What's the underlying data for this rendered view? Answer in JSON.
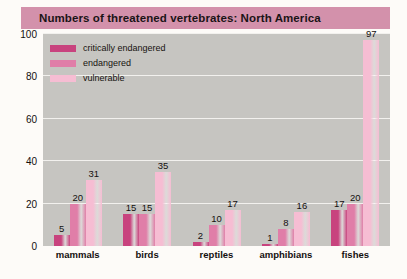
{
  "chart_data": {
    "type": "bar",
    "title": "Numbers of threatened vertebrates: North America",
    "xlabel": "",
    "ylabel": "",
    "ylim": [
      0,
      100
    ],
    "yticks": [
      0,
      20,
      40,
      60,
      80,
      100
    ],
    "grid": true,
    "legend_position": "top-left",
    "categories": [
      "mammals",
      "birds",
      "reptiles",
      "amphibians",
      "fishes"
    ],
    "series": [
      {
        "name": "critically endangered",
        "color": "#c8437e",
        "values": [
          5,
          15,
          2,
          1,
          17
        ]
      },
      {
        "name": "endangered",
        "color": "#e07ea8",
        "values": [
          20,
          15,
          10,
          8,
          20
        ]
      },
      {
        "name": "vulnerable",
        "color": "#f6bdd3",
        "values": [
          31,
          35,
          17,
          16,
          97
        ]
      }
    ]
  },
  "colors": {
    "title_banner": "#d391ab",
    "plot_background": "#c6c5c1",
    "gridline": "#f2f1ee",
    "page_background": "#fdfbf8"
  }
}
